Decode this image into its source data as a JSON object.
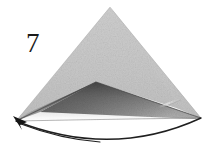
{
  "figure": {
    "label": "7",
    "caption_number": "7",
    "type": "line-and-tone illustration",
    "background_color": "#ffffff"
  },
  "palette": {
    "background": "#ffffff",
    "front_flap_light": "#c9c9c9",
    "front_flap_light_edge": "#bdbdbd",
    "left_wing_light": "#c4c4c4",
    "right_wing_light": "#cdcdcd",
    "under_fold_dark": "#5d5d5d",
    "under_fold_mid": "#7e7e7e",
    "under_fold_pale": "#a6a6a6",
    "outline_dark": "#1b1b1b",
    "arc_line": "#1f1f1f",
    "label_text": "#1a1a1a",
    "highlight_streak": "#e2e2e2"
  },
  "geometry": {
    "apex": {
      "x": 110,
      "y": 7
    },
    "left_tip": {
      "x": 16,
      "y": 121
    },
    "right_tip": {
      "x": 201,
      "y": 118
    },
    "fold_peak": {
      "x": 96,
      "y": 82
    },
    "left_shoulder": {
      "x": 40,
      "y": 110
    },
    "right_shoulder": {
      "x": 176,
      "y": 108
    },
    "base_arc_low_point": {
      "x": 112,
      "y": 141
    },
    "highlight_streak": {
      "x1": 160,
      "y1": 106,
      "x2": 178,
      "y2": 100
    }
  },
  "elements": {
    "upper_cone_label": "upper cone face",
    "left_wing_label": "left folded wing",
    "right_wing_label": "right folded wing",
    "under_fold_label": "shaded under fold",
    "base_arc_label": "circular base arc",
    "left_tip_label": "left pointed tip",
    "streak_label": "highlight streak"
  }
}
